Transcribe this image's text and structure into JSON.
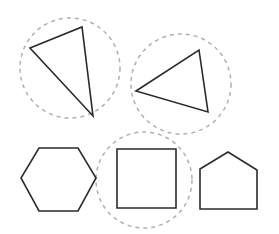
{
  "figure": {
    "title": "Geometric shapes with dashed grouping circles",
    "canvas": {
      "width": 279,
      "height": 234,
      "background": "#ffffff"
    },
    "style": {
      "shape_stroke_color": "#2b2b2b",
      "shape_stroke_width": 1.6,
      "circle_stroke_color": "#b0b0b0",
      "circle_stroke_width": 1.5,
      "circle_dash_pattern": "4 4",
      "fill": "none"
    },
    "shapes": [
      {
        "id": "triangle-upper-left",
        "name": "Triangle (upper left)",
        "type": "triangle",
        "sides": 3,
        "points": "30,48 82,27 93,116",
        "grouped": true
      },
      {
        "id": "triangle-upper-right",
        "name": "Triangle (upper right)",
        "type": "triangle",
        "sides": 3,
        "points": "136,91 199,50 208,112",
        "grouped": true
      },
      {
        "id": "hexagon-lower-left",
        "name": "Hexagon (lower left)",
        "type": "hexagon",
        "sides": 6,
        "points": "39,148 78,148 96,178 78,211 39,211 21,178",
        "grouped": false
      },
      {
        "id": "square-lower-middle",
        "name": "Square (lower middle)",
        "type": "square",
        "sides": 4,
        "points": "117,149 176,149 176,208 117,208",
        "grouped": true
      },
      {
        "id": "pentagon-lower-right",
        "name": "Pentagon / house (lower right)",
        "type": "pentagon",
        "sides": 5,
        "points": "200,169 228,152 257,170 257,209 200,209",
        "grouped": false
      }
    ],
    "grouping_circles": [
      {
        "id": "circle-triangle-upper-left",
        "name": "Dashed circle around upper-left triangle",
        "cx": 70,
        "cy": 68,
        "r": 50,
        "encircles": "triangle-upper-left"
      },
      {
        "id": "circle-triangle-upper-right",
        "name": "Dashed circle around upper-right triangle",
        "cx": 181,
        "cy": 84,
        "r": 50,
        "encircles": "triangle-upper-right"
      },
      {
        "id": "circle-square-lower-middle",
        "name": "Dashed circle around lower-middle square",
        "cx": 144,
        "cy": 180,
        "r": 48,
        "encircles": "square-lower-middle"
      }
    ],
    "counts": {
      "total_shapes": 5,
      "circled_shapes": 3,
      "uncircled_shapes": 2
    }
  }
}
